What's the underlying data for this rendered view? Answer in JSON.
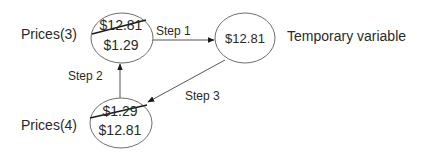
{
  "diagram": {
    "nodes": {
      "prices3": {
        "label": "Prices(3)",
        "old_value": "$12.81",
        "new_value": "$1.29"
      },
      "temp": {
        "value": "$12.81",
        "label": "Temporary variable"
      },
      "prices4": {
        "label": "Prices(4)",
        "old_value": "$1.29",
        "new_value": "$12.81"
      }
    },
    "edges": {
      "step1": {
        "label": "Step 1",
        "from": "prices3",
        "to": "temp"
      },
      "step2": {
        "label": "Step 2",
        "from": "prices4",
        "to": "prices3"
      },
      "step3": {
        "label": "Step 3",
        "from": "temp",
        "to": "prices4"
      }
    },
    "colors": {
      "stroke": "#6e6e6e",
      "text": "#2a2a2a",
      "strike": "#1a1a1a"
    }
  }
}
